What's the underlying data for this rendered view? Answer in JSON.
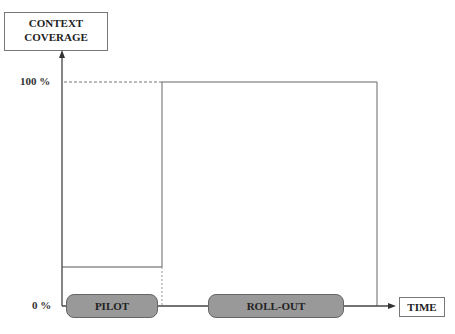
{
  "y_axis": {
    "label_line1": "CONTEXT",
    "label_line2": "COVERAGE",
    "tick_top": "100 %",
    "tick_bottom": "0 %"
  },
  "x_axis": {
    "label": "TIME"
  },
  "phases": [
    {
      "label": "PILOT",
      "level_percent": 17
    },
    {
      "label": "ROLL-OUT",
      "level_percent": 100
    }
  ],
  "colors": {
    "phase_fill": "#999999",
    "line": "#555555"
  }
}
